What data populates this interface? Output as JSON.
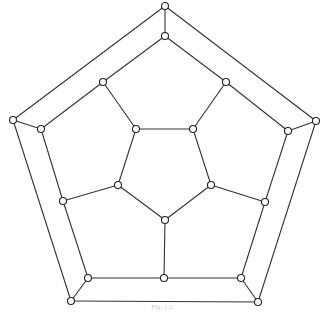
{
  "figure": {
    "type": "graph",
    "caption": "Fig. 1.2",
    "node_radius": 3.5,
    "colors": {
      "edge": "#333333",
      "node_stroke": "#222222",
      "node_fill": "#ffffff"
    },
    "nodes": [
      {
        "id": "o0",
        "x": 165,
        "y": 6
      },
      {
        "id": "o1",
        "x": 316,
        "y": 121
      },
      {
        "id": "o2",
        "x": 258,
        "y": 302
      },
      {
        "id": "o3",
        "x": 71,
        "y": 301
      },
      {
        "id": "o4",
        "x": 13,
        "y": 120
      },
      {
        "id": "a0",
        "x": 165,
        "y": 36
      },
      {
        "id": "a1",
        "x": 288,
        "y": 131
      },
      {
        "id": "a2",
        "x": 241,
        "y": 278
      },
      {
        "id": "a3",
        "x": 88,
        "y": 278
      },
      {
        "id": "a4",
        "x": 41,
        "y": 129
      },
      {
        "id": "b0",
        "x": 226,
        "y": 82
      },
      {
        "id": "b1",
        "x": 265,
        "y": 202
      },
      {
        "id": "b2",
        "x": 164,
        "y": 278
      },
      {
        "id": "b3",
        "x": 63,
        "y": 201
      },
      {
        "id": "b4",
        "x": 103,
        "y": 82
      },
      {
        "id": "c0",
        "x": 193,
        "y": 129
      },
      {
        "id": "c1",
        "x": 211,
        "y": 185
      },
      {
        "id": "c2",
        "x": 165,
        "y": 220
      },
      {
        "id": "c3",
        "x": 118,
        "y": 185
      },
      {
        "id": "c4",
        "x": 136,
        "y": 129
      }
    ],
    "edges": [
      [
        "o0",
        "o1"
      ],
      [
        "o1",
        "o2"
      ],
      [
        "o2",
        "o3"
      ],
      [
        "o3",
        "o4"
      ],
      [
        "o4",
        "o0"
      ],
      [
        "o0",
        "a0"
      ],
      [
        "o1",
        "a1"
      ],
      [
        "o2",
        "a2"
      ],
      [
        "o3",
        "a3"
      ],
      [
        "o4",
        "a4"
      ],
      [
        "a0",
        "b0"
      ],
      [
        "b0",
        "a1"
      ],
      [
        "a1",
        "b1"
      ],
      [
        "b1",
        "a2"
      ],
      [
        "a2",
        "b2"
      ],
      [
        "b2",
        "a3"
      ],
      [
        "a3",
        "b3"
      ],
      [
        "b3",
        "a4"
      ],
      [
        "a4",
        "b4"
      ],
      [
        "b4",
        "a0"
      ],
      [
        "b0",
        "c0"
      ],
      [
        "b1",
        "c1"
      ],
      [
        "b2",
        "c2"
      ],
      [
        "b3",
        "c3"
      ],
      [
        "b4",
        "c4"
      ],
      [
        "c0",
        "c1"
      ],
      [
        "c1",
        "c2"
      ],
      [
        "c2",
        "c3"
      ],
      [
        "c3",
        "c4"
      ],
      [
        "c4",
        "c0"
      ]
    ]
  }
}
